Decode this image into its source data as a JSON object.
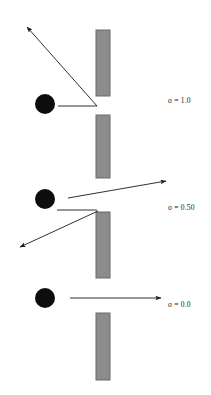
{
  "figure": {
    "name": "scattering-diagram",
    "background_color": "#ffffff",
    "width": 211,
    "height": 395,
    "stroke_color": "#1a1a1a",
    "particle_color": "#0d0d0d",
    "barrier_fill": "#8c8c8c",
    "barrier_stroke": "#6b6b6b"
  },
  "panels": [
    {
      "id": "panel-sigma-1",
      "label": "σ = 1.0",
      "label_x": 168,
      "label_y": 101,
      "particle": {
        "cx": 45,
        "cy": 104,
        "r": 10
      },
      "barriers": [
        {
          "x": 96,
          "y": 30,
          "w": 14,
          "h": 66
        },
        {
          "x": 96,
          "y": 115,
          "w": 14,
          "h": 63
        }
      ],
      "incoming_arrow": {
        "x1": 58,
        "y1": 106,
        "x2": 97,
        "y2": 106,
        "head": false
      },
      "outgoing_arrows": [
        {
          "x1": 97,
          "y1": 106,
          "x2": 27,
          "y2": 27,
          "head": true
        }
      ]
    },
    {
      "id": "panel-sigma-050",
      "label": "σ = 0.50",
      "label_x": 168,
      "label_y": 208,
      "particle": {
        "cx": 45,
        "cy": 199,
        "r": 10
      },
      "barriers": [
        {
          "x": 96,
          "y": 212,
          "w": 14,
          "h": 66
        }
      ],
      "incoming_arrow": {
        "x1": 57,
        "y1": 210,
        "x2": 97,
        "y2": 210,
        "head": false
      },
      "outgoing_arrows": [
        {
          "x1": 68,
          "y1": 198,
          "x2": 166,
          "y2": 181,
          "head": true
        },
        {
          "x1": 98,
          "y1": 211,
          "x2": 20,
          "y2": 247,
          "head": true
        }
      ]
    },
    {
      "id": "panel-sigma-0",
      "label": "σ = 0.0",
      "label_x": 168,
      "label_y": 305,
      "particle": {
        "cx": 45,
        "cy": 298,
        "r": 10
      },
      "barriers": [
        {
          "x": 96,
          "y": 313,
          "w": 14,
          "h": 67
        }
      ],
      "incoming_arrow": null,
      "outgoing_arrows": [
        {
          "x1": 70,
          "y1": 298,
          "x2": 161,
          "y2": 298,
          "head": true
        }
      ]
    }
  ]
}
